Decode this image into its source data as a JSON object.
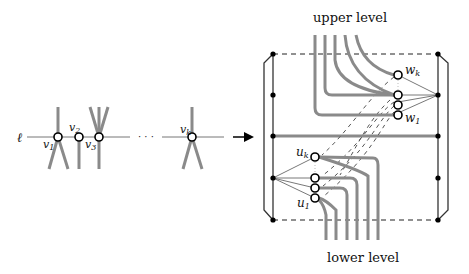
{
  "figure": {
    "left_part": {
      "line_label": "ℓ",
      "vertex_labels": [
        "v1",
        "v2",
        "v3",
        "vk"
      ],
      "ellipsis": "· · ·"
    },
    "right_part": {
      "top_label": "upper level",
      "bottom_label": "lower level",
      "upper_nodes": [
        "wk",
        "w1"
      ],
      "lower_nodes": [
        "uk",
        "u1"
      ]
    },
    "colors": {
      "thick_edge": "#8a8a8a",
      "frame": "#333333",
      "node_fill": "#ffffff",
      "node_stroke": "#000000"
    }
  }
}
